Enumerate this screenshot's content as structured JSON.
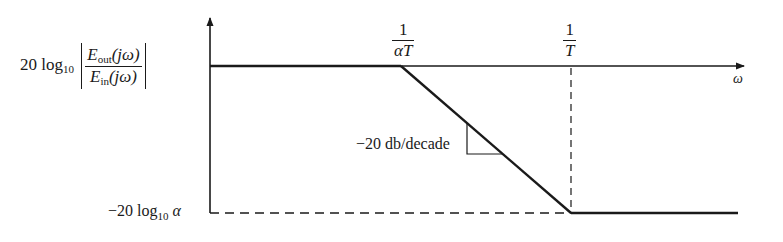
{
  "diagram": {
    "type": "bode-magnitude-asymptote",
    "y_axis_label": {
      "prefix": "20 log",
      "subscript": "10",
      "numerator_E": "E",
      "numerator_sub": "out",
      "numerator_arg": "(jω)",
      "denominator_E": "E",
      "denominator_sub": "in",
      "denominator_arg": "(jω)"
    },
    "y_low_label": {
      "prefix": "−20 log",
      "subscript": "10",
      "symbol": "α"
    },
    "x_axis_label": "ω",
    "breakpoints": [
      {
        "numerator": "1",
        "denominator": "αT"
      },
      {
        "numerator": "1",
        "denominator": "T"
      }
    ],
    "slope_label": "−20 db/decade",
    "colors": {
      "line": "#1a1a1a",
      "background": "#ffffff"
    }
  }
}
